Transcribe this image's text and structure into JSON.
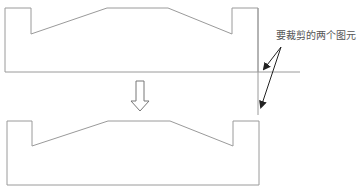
{
  "diagram": {
    "annotation": "要裁剪的两个图元",
    "colors": {
      "outline": "#9a9a9a",
      "arrow": "#222222",
      "text": "#555555",
      "background": "#ffffff"
    },
    "before_shape": {
      "points": "5,8 31,8 31,34 107,8 168,8 232,34 232,8 258,8 258,72 5,72"
    },
    "clip_lines": {
      "horizontal": {
        "x1": 258,
        "y1": 72,
        "x2": 300,
        "y2": 72
      },
      "vertical": {
        "x1": 258,
        "y1": 8,
        "x2": 258,
        "y2": 115
      }
    },
    "transform_arrow": {
      "direction": "down"
    },
    "after_shape": {
      "points": "7,121 32,121 32,146 108,121 170,121 233,146 233,121 259,121 259,185 7,185"
    }
  }
}
